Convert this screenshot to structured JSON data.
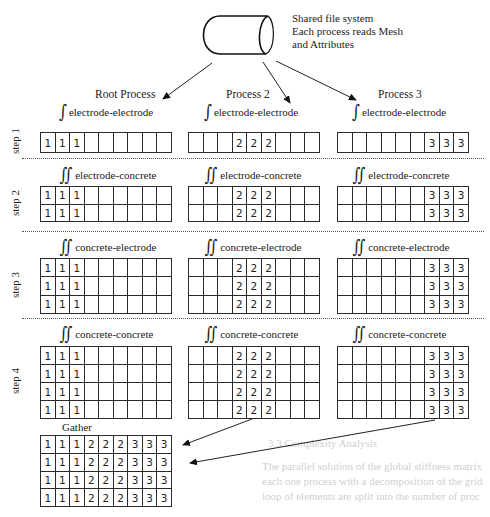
{
  "background_text": [
    {
      "text": "3.3  Complexity Analysis",
      "x": 268,
      "y": 437
    },
    {
      "text": "The parallel solution of the global stiffness matrix",
      "x": 262,
      "y": 460
    },
    {
      "text": "each one process with a decomposition of the grid",
      "x": 262,
      "y": 475
    },
    {
      "text": "loop of elements are split into the number of proc",
      "x": 262,
      "y": 490
    }
  ],
  "file_system": {
    "line1": "Shared file system",
    "line2": "Each process reads Mesh",
    "line3": "and Attributes"
  },
  "columns": [
    {
      "id": "root",
      "title": "Root Process"
    },
    {
      "id": "p2",
      "title": "Process 2"
    },
    {
      "id": "p3",
      "title": "Process 3"
    }
  ],
  "steps": [
    {
      "label": "step 1",
      "integral": "∫",
      "term": "electrode-electrode",
      "rows": 1
    },
    {
      "label": "step 2",
      "integral": "∬",
      "term": "electrode-concrete",
      "rows": 2
    },
    {
      "label": "step 3",
      "integral": "∬",
      "term": "concrete-electrode",
      "rows": 3
    },
    {
      "label": "step 4",
      "integral": "∬",
      "term": "concrete-concrete",
      "rows": 4
    }
  ],
  "grid_columns": 9,
  "process_values": {
    "root": {
      "value": "1",
      "cols": [
        0,
        1,
        2
      ]
    },
    "p2": {
      "value": "2",
      "cols": [
        3,
        4,
        5
      ]
    },
    "p3": {
      "value": "3",
      "cols": [
        6,
        7,
        8
      ]
    }
  },
  "gather": {
    "title": "Gather",
    "rows": [
      [
        "1",
        "1",
        "1",
        "2",
        "2",
        "2",
        "3",
        "3",
        "3"
      ],
      [
        "1",
        "1",
        "1",
        "2",
        "2",
        "2",
        "3",
        "3",
        "3"
      ],
      [
        "1",
        "1",
        "1",
        "2",
        "2",
        "2",
        "3",
        "3",
        "3"
      ],
      [
        "1",
        "1",
        "1",
        "2",
        "2",
        "2",
        "3",
        "3",
        "3"
      ]
    ]
  }
}
